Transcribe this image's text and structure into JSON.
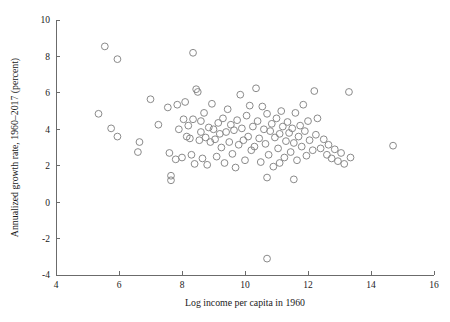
{
  "chart_data": {
    "type": "scatter",
    "title": "",
    "xlabel": "Log income per capita in 1960",
    "ylabel": "Annualized growth rate, 1960–2017 (percent)",
    "xlim": [
      4,
      16
    ],
    "ylim": [
      -4,
      10
    ],
    "xticks": [
      4,
      6,
      8,
      10,
      12,
      14,
      16
    ],
    "yticks": [
      -4,
      -2,
      0,
      2,
      4,
      6,
      8,
      10
    ],
    "xtick_labels": [
      "4",
      "6",
      "8",
      "10",
      "12",
      "14",
      "16"
    ],
    "ytick_labels": [
      "-4",
      "-2",
      "0",
      "2",
      "4",
      "6",
      "8",
      "10"
    ],
    "grid": false,
    "legend": false,
    "marker": "open-circle",
    "marker_color": "#8a8a8a",
    "marker_radius_px": 3.4,
    "points": [
      [
        5.55,
        8.55
      ],
      [
        5.95,
        7.85
      ],
      [
        8.35,
        8.2
      ],
      [
        5.35,
        4.85
      ],
      [
        5.75,
        4.05
      ],
      [
        5.95,
        3.6
      ],
      [
        6.65,
        3.3
      ],
      [
        6.6,
        2.75
      ],
      [
        7.0,
        5.65
      ],
      [
        7.25,
        4.25
      ],
      [
        7.55,
        5.2
      ],
      [
        7.6,
        2.7
      ],
      [
        7.65,
        1.45
      ],
      [
        7.65,
        1.2
      ],
      [
        7.8,
        2.35
      ],
      [
        7.85,
        5.35
      ],
      [
        7.9,
        4.0
      ],
      [
        8.0,
        2.45
      ],
      [
        8.05,
        4.55
      ],
      [
        8.1,
        5.5
      ],
      [
        8.15,
        3.6
      ],
      [
        8.2,
        4.2
      ],
      [
        8.25,
        3.5
      ],
      [
        8.3,
        2.6
      ],
      [
        8.35,
        4.55
      ],
      [
        8.4,
        2.1
      ],
      [
        8.45,
        6.2
      ],
      [
        8.5,
        6.05
      ],
      [
        8.55,
        3.4
      ],
      [
        8.6,
        4.45
      ],
      [
        8.6,
        3.85
      ],
      [
        8.65,
        2.4
      ],
      [
        8.7,
        4.9
      ],
      [
        8.75,
        3.55
      ],
      [
        8.8,
        2.05
      ],
      [
        8.85,
        4.1
      ],
      [
        8.9,
        3.3
      ],
      [
        8.95,
        5.4
      ],
      [
        9.0,
        4.0
      ],
      [
        9.05,
        3.45
      ],
      [
        9.1,
        2.5
      ],
      [
        9.15,
        4.35
      ],
      [
        9.2,
        3.75
      ],
      [
        9.25,
        3.0
      ],
      [
        9.3,
        4.6
      ],
      [
        9.35,
        2.15
      ],
      [
        9.4,
        3.85
      ],
      [
        9.45,
        5.1
      ],
      [
        9.5,
        3.3
      ],
      [
        9.55,
        4.25
      ],
      [
        9.6,
        2.65
      ],
      [
        9.65,
        3.95
      ],
      [
        9.7,
        1.9
      ],
      [
        9.75,
        4.5
      ],
      [
        9.8,
        3.15
      ],
      [
        9.85,
        5.9
      ],
      [
        9.9,
        4.05
      ],
      [
        9.95,
        3.4
      ],
      [
        10.0,
        2.3
      ],
      [
        10.05,
        4.75
      ],
      [
        10.1,
        3.6
      ],
      [
        10.15,
        5.3
      ],
      [
        10.2,
        2.85
      ],
      [
        10.25,
        4.15
      ],
      [
        10.3,
        3.05
      ],
      [
        10.35,
        6.25
      ],
      [
        10.4,
        4.45
      ],
      [
        10.45,
        3.5
      ],
      [
        10.5,
        2.2
      ],
      [
        10.55,
        5.25
      ],
      [
        10.6,
        4.0
      ],
      [
        10.65,
        3.2
      ],
      [
        10.7,
        4.85
      ],
      [
        10.75,
        2.6
      ],
      [
        10.8,
        3.9
      ],
      [
        10.85,
        4.3
      ],
      [
        10.9,
        1.95
      ],
      [
        10.95,
        3.55
      ],
      [
        11.0,
        4.6
      ],
      [
        11.05,
        2.95
      ],
      [
        11.1,
        3.75
      ],
      [
        11.15,
        5.0
      ],
      [
        11.2,
        4.15
      ],
      [
        11.25,
        2.45
      ],
      [
        11.3,
        3.35
      ],
      [
        11.35,
        4.4
      ],
      [
        11.4,
        3.8
      ],
      [
        11.45,
        2.75
      ],
      [
        11.5,
        4.05
      ],
      [
        11.55,
        3.25
      ],
      [
        11.6,
        4.9
      ],
      [
        11.65,
        2.3
      ],
      [
        11.7,
        3.6
      ],
      [
        11.75,
        4.2
      ],
      [
        11.8,
        3.05
      ],
      [
        11.85,
        5.35
      ],
      [
        11.9,
        3.9
      ],
      [
        11.95,
        2.55
      ],
      [
        12.0,
        4.45
      ],
      [
        12.05,
        3.4
      ],
      [
        12.15,
        2.85
      ],
      [
        12.25,
        3.7
      ],
      [
        12.3,
        4.6
      ],
      [
        12.4,
        2.95
      ],
      [
        12.5,
        3.45
      ],
      [
        12.6,
        2.6
      ],
      [
        12.65,
        3.15
      ],
      [
        12.75,
        2.4
      ],
      [
        12.85,
        2.9
      ],
      [
        12.95,
        2.25
      ],
      [
        13.05,
        2.7
      ],
      [
        13.15,
        2.1
      ],
      [
        13.3,
        6.05
      ],
      [
        13.35,
        2.45
      ],
      [
        12.2,
        6.1
      ],
      [
        11.55,
        1.25
      ],
      [
        10.7,
        1.35
      ],
      [
        11.1,
        2.15
      ],
      [
        14.7,
        3.1
      ],
      [
        10.7,
        -3.1
      ]
    ]
  }
}
